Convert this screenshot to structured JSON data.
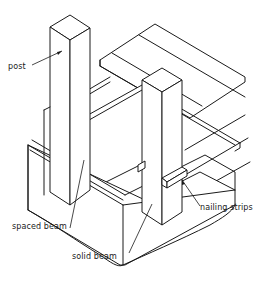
{
  "diagram": {
    "type": "isometric construction illustration",
    "labels": {
      "post": "post",
      "spaced_beam": "spaced beam",
      "solid_beam": "solid beam",
      "nailing_strips": "nailing strips"
    },
    "colors": {
      "line": "#1a1a1a",
      "background": "#ffffff"
    }
  }
}
